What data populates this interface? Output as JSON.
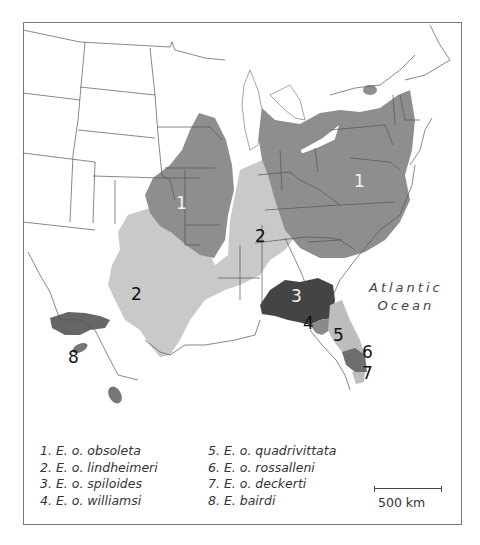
{
  "map": {
    "ocean_label": [
      "Atlantic",
      "Ocean"
    ],
    "region_labels": [
      {
        "id": "1",
        "x": 181,
        "y": 203,
        "light": true
      },
      {
        "id": "1",
        "x": 359,
        "y": 181,
        "light": true
      },
      {
        "id": "2",
        "x": 136,
        "y": 294,
        "light": false
      },
      {
        "id": "2",
        "x": 260,
        "y": 236,
        "light": false
      },
      {
        "id": "3",
        "x": 296,
        "y": 296,
        "light": true
      },
      {
        "id": "4",
        "x": 308,
        "y": 323,
        "light": false
      },
      {
        "id": "5",
        "x": 338,
        "y": 335,
        "light": false
      },
      {
        "id": "6",
        "x": 367,
        "y": 352,
        "light": false
      },
      {
        "id": "7",
        "x": 367,
        "y": 373,
        "light": false
      },
      {
        "id": "8",
        "x": 73,
        "y": 357,
        "light": false
      }
    ],
    "colors": {
      "region_1": "#8e8e8e",
      "region_2": "#c9c9c9",
      "region_3": "#444444",
      "region_4": "#8a8a8a",
      "region_5": "#bdbdbd",
      "region_6": "#6e6e6e",
      "region_7": "#bdbdbd",
      "region_8": "#6a6a6a",
      "border": "#555555"
    }
  },
  "legend": {
    "items": [
      "1. E. o. obsoleta",
      "2. E. o. lindheimeri",
      "3. E. o. spiloides",
      "4. E. o. williamsi",
      "5. E. o. quadrivittata",
      "6. E. o. rossalleni",
      "7. E. o. deckerti",
      "8. E. bairdi"
    ]
  },
  "scale_bar": {
    "label": "500 km"
  }
}
